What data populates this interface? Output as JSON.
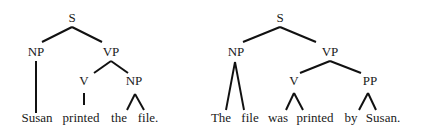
{
  "trees": [
    {
      "name": "active-sentence-tree",
      "nodes": {
        "S": {
          "label": "S",
          "x": 72,
          "y": 22
        },
        "NP": {
          "label": "NP",
          "x": 36,
          "y": 56
        },
        "VP": {
          "label": "VP",
          "x": 111,
          "y": 56
        },
        "V": {
          "label": "V",
          "x": 84,
          "y": 85
        },
        "NP2": {
          "label": "NP",
          "x": 134,
          "y": 85
        }
      },
      "words": [
        {
          "text": "Susan",
          "x": 37
        },
        {
          "text": "printed",
          "x": 81
        },
        {
          "text": "the",
          "x": 119
        },
        {
          "text": "file.",
          "x": 148
        }
      ],
      "word_baseline": 122,
      "edges": [
        [
          72,
          27,
          42,
          42
        ],
        [
          72,
          27,
          102,
          42
        ],
        [
          36,
          61,
          36,
          113
        ],
        [
          111,
          61,
          94,
          73
        ],
        [
          111,
          61,
          128,
          73
        ],
        [
          84,
          93,
          84,
          105
        ],
        [
          135,
          94,
          127,
          110
        ],
        [
          135,
          94,
          144,
          110
        ]
      ]
    },
    {
      "name": "passive-sentence-tree",
      "nodes": {
        "S": {
          "label": "S",
          "x": 280,
          "y": 22
        },
        "NP": {
          "label": "NP",
          "x": 236,
          "y": 56
        },
        "VP": {
          "label": "VP",
          "x": 330,
          "y": 56
        },
        "V": {
          "label": "V",
          "x": 294,
          "y": 85
        },
        "PP": {
          "label": "PP",
          "x": 370,
          "y": 85
        }
      },
      "words": [
        {
          "text": "The",
          "x": 221
        },
        {
          "text": "file",
          "x": 250
        },
        {
          "text": "was",
          "x": 278
        },
        {
          "text": "printed",
          "x": 315
        },
        {
          "text": "by",
          "x": 351
        },
        {
          "text": "Susan.",
          "x": 383
        }
      ],
      "word_baseline": 122,
      "edges": [
        [
          280,
          27,
          243,
          42
        ],
        [
          280,
          27,
          316,
          42
        ],
        [
          235,
          62,
          226,
          110
        ],
        [
          235,
          62,
          244,
          110
        ],
        [
          330,
          61,
          300,
          73
        ],
        [
          330,
          61,
          361,
          73
        ],
        [
          294,
          93,
          286,
          110
        ],
        [
          294,
          93,
          303,
          110
        ],
        [
          368,
          93,
          359,
          110
        ],
        [
          368,
          93,
          376,
          110
        ]
      ]
    }
  ]
}
